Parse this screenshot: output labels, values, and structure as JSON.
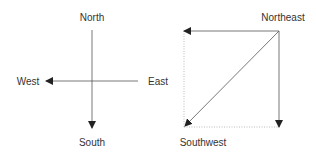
{
  "left_diagram": {
    "labels": {
      "north": "North",
      "south": "South",
      "east": "East",
      "west": "West"
    }
  },
  "right_diagram": {
    "labels": {
      "northeast": "Northeast",
      "southwest": "Southwest"
    }
  },
  "colors": {
    "line": "#333333",
    "dotted": "#999999",
    "text": "#333333"
  }
}
